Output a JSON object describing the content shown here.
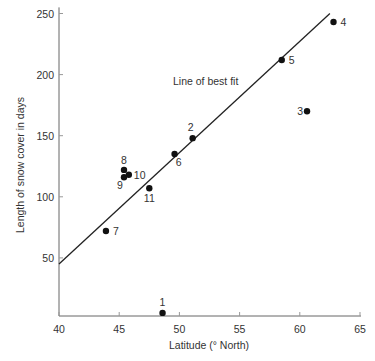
{
  "chart_data": {
    "type": "scatter",
    "title": "",
    "xlabel": "Latitude (° North)",
    "ylabel": "Length of snow cover in days",
    "xlim": [
      40,
      65
    ],
    "ylim": [
      0,
      255
    ],
    "xticks": [
      40,
      45,
      50,
      55,
      60,
      65
    ],
    "yticks": [
      50,
      100,
      150,
      200,
      250
    ],
    "grid": false,
    "points": [
      {
        "label": "1",
        "x": 48.6,
        "y": 5
      },
      {
        "label": "2",
        "x": 51.1,
        "y": 148
      },
      {
        "label": "3",
        "x": 60.6,
        "y": 170
      },
      {
        "label": "4",
        "x": 62.8,
        "y": 243
      },
      {
        "label": "5",
        "x": 58.5,
        "y": 212
      },
      {
        "label": "6",
        "x": 49.6,
        "y": 135
      },
      {
        "label": "7",
        "x": 43.9,
        "y": 72
      },
      {
        "label": "8",
        "x": 45.4,
        "y": 122
      },
      {
        "label": "9",
        "x": 45.4,
        "y": 116
      },
      {
        "label": "10",
        "x": 45.8,
        "y": 118
      },
      {
        "label": "11",
        "x": 47.5,
        "y": 107
      }
    ],
    "best_fit_line": {
      "label": "Line of best fit",
      "x0": 40,
      "y0": 45,
      "x1": 62.5,
      "y1": 250
    },
    "annotations": [
      {
        "text": "Line of best fit",
        "x": 51.5,
        "y": 217
      }
    ]
  },
  "colors": {
    "axis": "#555555",
    "point": "#111111",
    "line": "#222222",
    "text": "#333333"
  }
}
